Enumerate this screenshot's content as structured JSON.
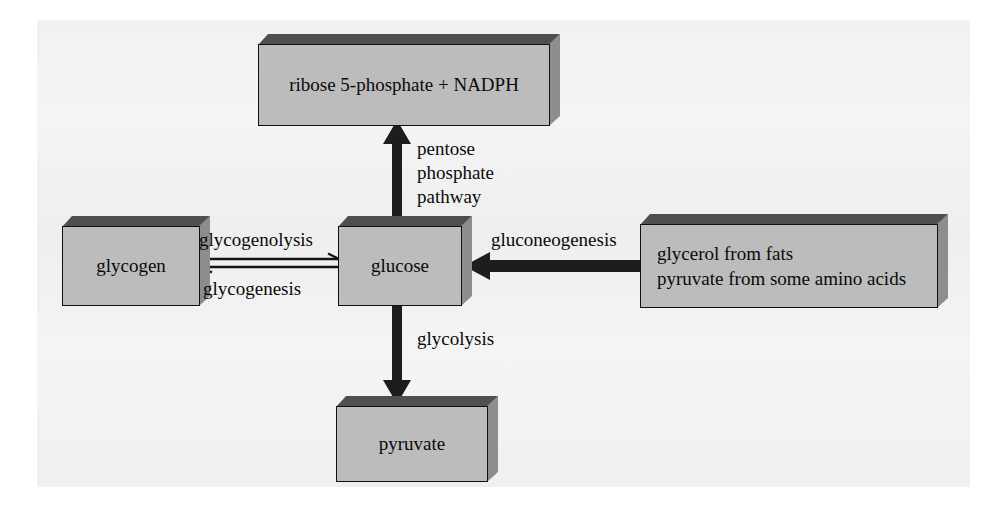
{
  "diagram": {
    "background_color": "#f4f4f4",
    "box_fill_color": "#bcbcbc",
    "box_top_color": "#4f4f4f",
    "box_side_color": "#8d8d8d",
    "arrow_color": "#1a1a1a",
    "text_color": "#0a0a0a"
  },
  "nodes": {
    "ribose": {
      "line1": "ribose 5-phosphate  +  NADPH"
    },
    "glycogen": {
      "line1": "glycogen"
    },
    "glucose": {
      "line1": "glucose"
    },
    "pyruvate": {
      "line1": "pyruvate"
    },
    "precursors": {
      "line1": "glycerol from fats",
      "line2": "pyruvate from some amino acids"
    }
  },
  "pathway_labels": {
    "pentose_line1": "pentose",
    "pentose_line2": "phosphate",
    "pentose_line3": "pathway",
    "glycogenolysis": "glycogenolysis",
    "glycogenesis": "glycogenesis",
    "gluconeogenesis": "gluconeogenesis",
    "glycolysis": "glycolysis"
  },
  "arrows": {
    "pentose_phosphate": {
      "direction": "up",
      "from": "glucose",
      "to": "ribose",
      "style": "thick-solid"
    },
    "glycolysis": {
      "direction": "down",
      "from": "glucose",
      "to": "pyruvate",
      "style": "thick-solid"
    },
    "gluconeogenesis": {
      "direction": "left",
      "from": "precursors",
      "to": "glucose",
      "style": "thick-solid"
    },
    "glycogenolysis": {
      "direction": "right",
      "from": "glycogen",
      "to": "glucose",
      "style": "thin-equilibrium"
    },
    "glycogenesis": {
      "direction": "left",
      "from": "glucose",
      "to": "glycogen",
      "style": "thin-equilibrium"
    }
  }
}
